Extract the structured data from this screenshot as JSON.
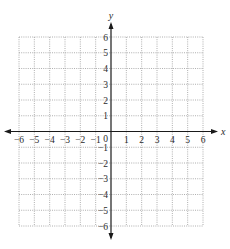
{
  "chart_data": {
    "type": "scatter",
    "title": "",
    "xlabel": "x",
    "ylabel": "y",
    "xlim": [
      -6,
      6
    ],
    "ylim": [
      -6,
      6
    ],
    "grid": true,
    "grid_style": "dotted",
    "x_ticks": [
      -6,
      -5,
      -4,
      -3,
      -2,
      -1,
      1,
      2,
      3,
      4,
      5,
      6
    ],
    "y_ticks": [
      -6,
      -5,
      -4,
      -3,
      -2,
      -1,
      1,
      2,
      3,
      4,
      5,
      6
    ],
    "origin_label": "0",
    "series": [],
    "legend": null
  },
  "colors": {
    "axis": "#1a1a1a",
    "grid": "#9a9a9a",
    "text": "#2a2a2a"
  }
}
